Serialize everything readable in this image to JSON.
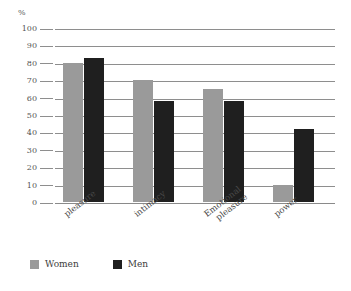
{
  "chart_data": {
    "type": "bar",
    "title": "",
    "subtitle": "",
    "xlabel": "",
    "ylabel": "%",
    "unit_label": "%",
    "ylim": [
      0,
      100
    ],
    "ytick_step": 10,
    "yticks": [
      "100",
      "90",
      "80",
      "70",
      "60",
      "50",
      "40",
      "30",
      "20",
      "10",
      "0"
    ],
    "grid": true,
    "grid_axis": "y",
    "legend_position": "bottom-left",
    "categories": [
      "pleasure",
      "intimacy",
      "Emotional pleasure",
      "power"
    ],
    "category_lines": [
      [
        "pleasure"
      ],
      [
        "intimacy"
      ],
      [
        "Emotional",
        "pleasure"
      ],
      [
        "power"
      ]
    ],
    "series": [
      {
        "name": "Women",
        "color": "#9a9a9a",
        "values": [
          80,
          70,
          65,
          10
        ]
      },
      {
        "name": "Men",
        "color": "#1f1f1f",
        "values": [
          83,
          58,
          58,
          42
        ]
      }
    ]
  },
  "legend": {
    "items": [
      {
        "label": "Women",
        "color": "#9a9a9a"
      },
      {
        "label": "Men",
        "color": "#1f1f1f"
      }
    ]
  },
  "colors": {
    "women": "#9a9a9a",
    "men": "#1f1f1f",
    "gridline": "#8e8e8e",
    "text": "#4a4a4a",
    "background": "#ffffff"
  }
}
